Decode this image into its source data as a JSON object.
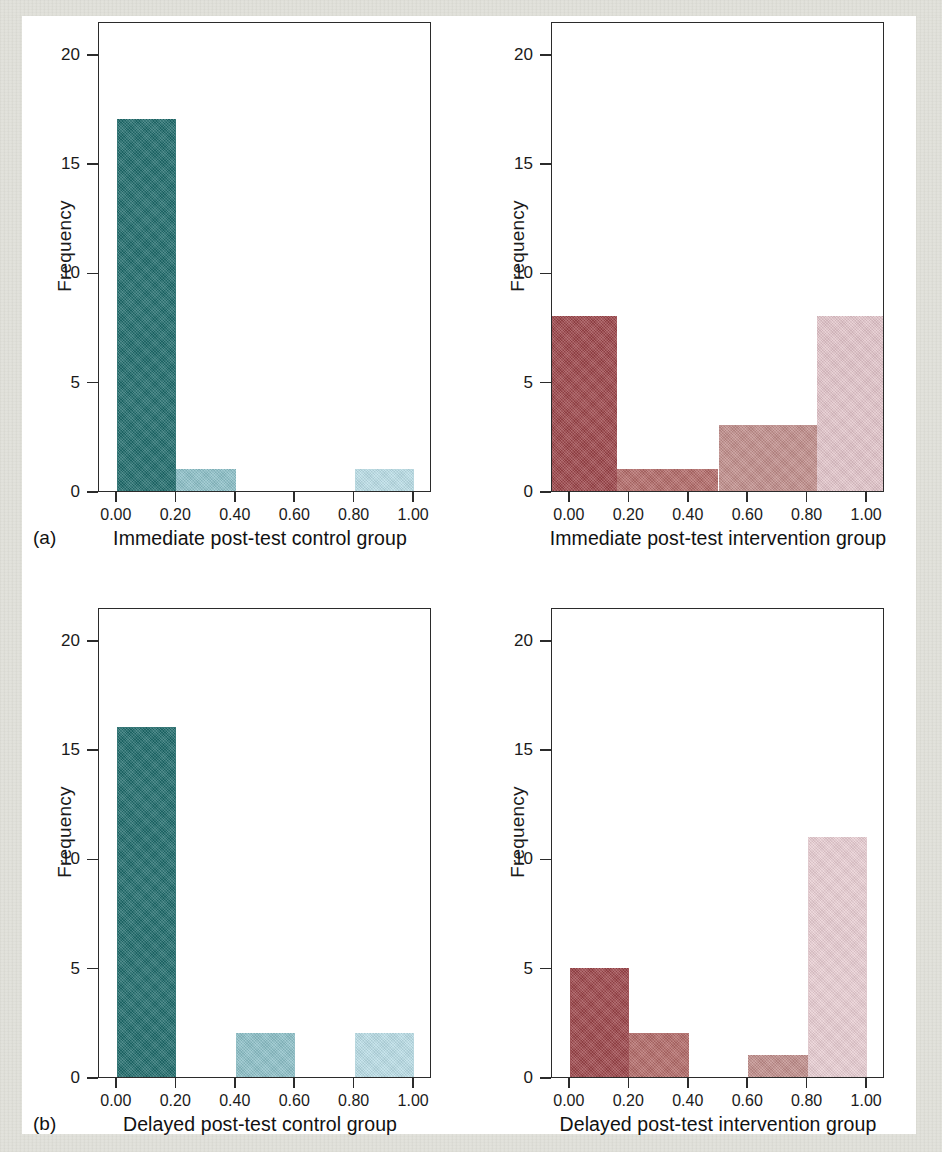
{
  "figure": {
    "panel_labels": [
      "(a)",
      "(b)"
    ],
    "y_axis_title": "Frequency",
    "y_ticks": [
      "0",
      "5",
      "10",
      "15",
      "20"
    ],
    "x_ticks": [
      "0.00",
      "0.20",
      "0.40",
      "0.60",
      "0.80",
      "1.00"
    ],
    "colors": {
      "teal_dark": "#1f6b6b",
      "teal_mid": "#8cc0c8",
      "teal_light": "#b9dde6",
      "red_dark": "#9b4449",
      "red_mid": "#bf7a78",
      "red_light": "#c98f8c",
      "pink_light": "#e8cdd2",
      "axis": "#2b2b2b",
      "text": "#111111",
      "paper_edge": "#ecece6"
    }
  },
  "chart_data": [
    {
      "id": "immediate-control",
      "type": "bar",
      "title": "",
      "xlabel": "Immediate post-test control group",
      "ylabel": "Frequency",
      "panel": "(a)",
      "position": "top-left",
      "xlim": [
        -0.06,
        1.06
      ],
      "ylim": [
        0,
        21.5
      ],
      "yticks": [
        0,
        5,
        10,
        15,
        20
      ],
      "xticks": [
        0.0,
        0.2,
        0.4,
        0.6,
        0.8,
        1.0
      ],
      "grid": false,
      "legend": "none",
      "bins": [
        {
          "x0": 0.0,
          "x1": 0.2,
          "value": 17,
          "color": "#1f6b6b"
        },
        {
          "x0": 0.2,
          "x1": 0.4,
          "value": 1,
          "color": "#8cc0c8"
        },
        {
          "x0": 0.8,
          "x1": 1.0,
          "value": 1,
          "color": "#b9dde6"
        }
      ]
    },
    {
      "id": "immediate-intervention",
      "type": "bar",
      "title": "",
      "xlabel": "Immediate post-test intervention group",
      "ylabel": "Frequency",
      "panel": "(a)",
      "position": "top-right",
      "xlim": [
        -0.06,
        1.06
      ],
      "ylim": [
        0,
        21.5
      ],
      "yticks": [
        0,
        5,
        10,
        15,
        20
      ],
      "xticks": [
        0.0,
        0.2,
        0.4,
        0.6,
        0.8,
        1.0
      ],
      "grid": false,
      "legend": "none",
      "bins": [
        {
          "x0": -0.06,
          "x1": 0.16,
          "value": 8,
          "color": "#9b4449"
        },
        {
          "x0": 0.16,
          "x1": 0.5,
          "value": 1,
          "color": "#b26a68"
        },
        {
          "x0": 0.5,
          "x1": 0.83,
          "value": 3,
          "color": "#c08d8a"
        },
        {
          "x0": 0.83,
          "x1": 1.06,
          "value": 8,
          "color": "#e2c4ca"
        }
      ]
    },
    {
      "id": "delayed-control",
      "type": "bar",
      "title": "",
      "xlabel": "Delayed post-test control group",
      "ylabel": "Frequency",
      "panel": "(b)",
      "position": "bottom-left",
      "xlim": [
        -0.06,
        1.06
      ],
      "ylim": [
        0,
        21.5
      ],
      "yticks": [
        0,
        5,
        10,
        15,
        20
      ],
      "xticks": [
        0.0,
        0.2,
        0.4,
        0.6,
        0.8,
        1.0
      ],
      "grid": false,
      "legend": "none",
      "bins": [
        {
          "x0": 0.0,
          "x1": 0.2,
          "value": 16,
          "color": "#1f6b6b"
        },
        {
          "x0": 0.4,
          "x1": 0.6,
          "value": 2,
          "color": "#8cc0c8"
        },
        {
          "x0": 0.8,
          "x1": 1.0,
          "value": 2,
          "color": "#b9dde6"
        }
      ]
    },
    {
      "id": "delayed-intervention",
      "type": "bar",
      "title": "",
      "xlabel": "Delayed post-test intervention group",
      "ylabel": "Frequency",
      "panel": "(b)",
      "position": "bottom-right",
      "xlim": [
        -0.06,
        1.06
      ],
      "ylim": [
        0,
        21.5
      ],
      "yticks": [
        0,
        5,
        10,
        15,
        20
      ],
      "xticks": [
        0.0,
        0.2,
        0.4,
        0.6,
        0.8,
        1.0
      ],
      "grid": false,
      "legend": "none",
      "bins": [
        {
          "x0": 0.0,
          "x1": 0.2,
          "value": 5,
          "color": "#9b4449"
        },
        {
          "x0": 0.2,
          "x1": 0.4,
          "value": 2,
          "color": "#b26a68"
        },
        {
          "x0": 0.6,
          "x1": 0.8,
          "value": 1,
          "color": "#c08d8a"
        },
        {
          "x0": 0.8,
          "x1": 1.0,
          "value": 11,
          "color": "#e8cdd2"
        }
      ]
    }
  ]
}
